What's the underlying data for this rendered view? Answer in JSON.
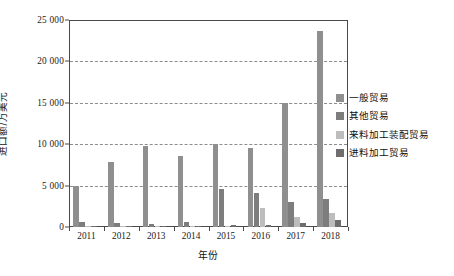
{
  "chart_data": {
    "type": "bar",
    "title": "",
    "xlabel": "年份",
    "ylabel": "进口额/万美元",
    "categories": [
      "2011",
      "2012",
      "2013",
      "2014",
      "2015",
      "2016",
      "2017",
      "2018"
    ],
    "series": [
      {
        "name": "一般贸易",
        "color": "#8f8f8f",
        "values": [
          4900,
          7850,
          9750,
          8550,
          10000,
          9500,
          15000,
          23700
        ]
      },
      {
        "name": "其他贸易",
        "color": "#7d7d7d",
        "values": [
          600,
          430,
          400,
          580,
          4600,
          4100,
          3000,
          3400
        ]
      },
      {
        "name": "来料加工装配贸易",
        "color": "#bdbdbd",
        "values": [
          40,
          30,
          20,
          60,
          180,
          2300,
          1250,
          1650
        ]
      },
      {
        "name": "进料加工贸易",
        "color": "#6e6e6e",
        "values": [
          60,
          50,
          60,
          90,
          230,
          260,
          440,
          880
        ]
      }
    ],
    "ylim": [
      0,
      25000
    ],
    "yticks": [
      0,
      5000,
      10000,
      15000,
      20000,
      25000
    ],
    "ytick_labels": [
      "0",
      "5 000",
      "10 000",
      "15 000",
      "20 000",
      "25 000"
    ],
    "grid": "horizontal-dashed",
    "legend_position": "right",
    "axis_color": "#4a4a4a",
    "grid_color": "#8c8c8c",
    "background": "#ffffff"
  },
  "legend": {
    "items": [
      {
        "label": "一般贸易",
        "swatch": "legend-swatch-general-trade"
      },
      {
        "label": "其他贸易",
        "swatch": "legend-swatch-other-trade"
      },
      {
        "label": "来料加工装配贸易",
        "swatch": "legend-swatch-processing-assembly"
      },
      {
        "label": "进料加工贸易",
        "swatch": "legend-swatch-import-processing"
      }
    ]
  }
}
